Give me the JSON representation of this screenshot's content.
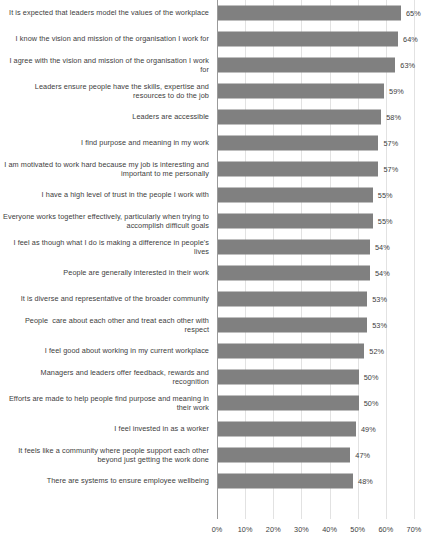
{
  "chart_data": {
    "type": "bar",
    "orientation": "horizontal",
    "title": "",
    "subtitle": "",
    "xlabel": "",
    "ylabel": "",
    "xlim": [
      0,
      70
    ],
    "x_tick_labels": [
      "0%",
      "10%",
      "20%",
      "30%",
      "40%",
      "50%",
      "60%",
      "70%"
    ],
    "x_tick_values": [
      0,
      10,
      20,
      30,
      40,
      50,
      60,
      70
    ],
    "grid": true,
    "legend": false,
    "value_label_suffix": "%",
    "bar_color": "#808080",
    "gridline_color": "#e2e2e2",
    "axis_color": "#9a9a9a",
    "categories": [
      "It is expected that leaders model the values of the workplace",
      "I know the vision and mission of the organisation I work for",
      "I agree with the vision and mission of the organisation I work for",
      "Leaders ensure people have the skills, expertise and resources to do the job",
      "Leaders are accessible",
      "I find purpose and meaning in my work",
      "I am motivated to work hard because my job is interesting and important to me personally",
      "I have a high level of trust in the people I work with",
      "Everyone works together effectively, particularly when trying to accomplish difficult goals",
      "I feel as though what I do is making a difference in people's lives",
      "People are generally interested in their work",
      "It is diverse and representative of the broader community",
      "People  care about each other and treat each other with respect",
      "I feel good about working in my current workplace",
      "Managers and leaders offer feedback, rewards and recognition",
      "Efforts are made to help people find purpose and meaning in their work",
      "I feel invested in as a worker",
      "It feels like a community where people support each other beyond just getting the work done",
      "There are systems to ensure employee wellbeing"
    ],
    "values": [
      65,
      64,
      63,
      59,
      58,
      57,
      57,
      55,
      55,
      54,
      54,
      53,
      53,
      52,
      50,
      50,
      49,
      47,
      48
    ],
    "value_labels": [
      "65%",
      "64%",
      "63%",
      "59%",
      "58%",
      "57%",
      "57%",
      "55%",
      "55%",
      "54%",
      "54%",
      "53%",
      "53%",
      "52%",
      "50%",
      "50%",
      "49%",
      "47%",
      "48%"
    ]
  }
}
